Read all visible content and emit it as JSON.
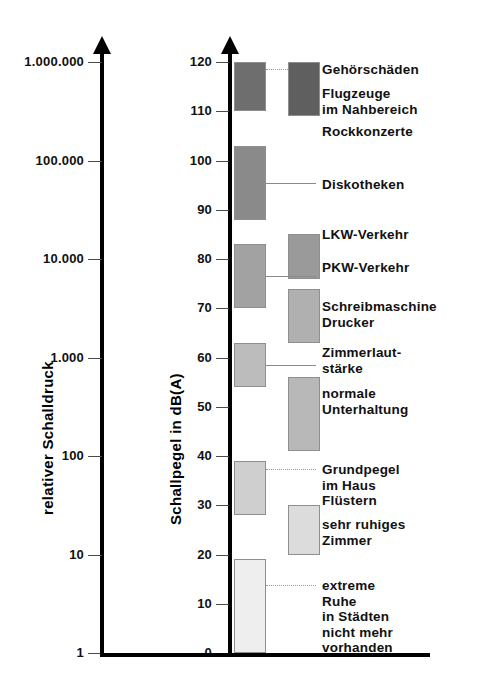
{
  "chart_data": {
    "type": "bar",
    "title": "",
    "subtitle": "",
    "orientation": "vertical-ranges",
    "grid": false,
    "legend": null,
    "left_axis": {
      "label": "relativer Schalldruck",
      "scale": "log",
      "tick_labels": [
        "1.000.000",
        "100.000",
        "10.000",
        "1.000",
        "100",
        "10",
        "1"
      ],
      "tick_values": [
        1000000,
        100000,
        10000,
        1000,
        100,
        10,
        1
      ],
      "tick_db_equivalent": [
        120,
        100,
        80,
        60,
        40,
        20,
        0
      ]
    },
    "right_axis": {
      "label": "Schallpegel in dB(A)",
      "scale": "linear",
      "ylim": [
        0,
        120
      ],
      "tick_labels": [
        "120",
        "110",
        "100",
        "90",
        "80",
        "70",
        "60",
        "50",
        "40",
        "30",
        "20",
        "10",
        "0"
      ],
      "tick_values": [
        120,
        110,
        100,
        90,
        80,
        70,
        60,
        50,
        40,
        30,
        20,
        10,
        0
      ]
    },
    "ylabel": "Schallpegel in dB(A)",
    "xlabel": "",
    "bars": [
      {
        "name": "Gehörschäden",
        "column": 1,
        "db_low": 110,
        "db_high": 120,
        "color": "#6e6e6e",
        "label": "Gehörschäden",
        "leader": "dotted"
      },
      {
        "name": "Flugzeuge im Nahbereich",
        "column": 2,
        "db_low": 109,
        "db_high": 120,
        "color": "#5f5f5f",
        "label": "Flugzeuge\nim Nahbereich",
        "leader": "solid"
      },
      {
        "name": "Rockkonzerte",
        "column": 0,
        "db_low": null,
        "db_high": null,
        "color": null,
        "label": "Rockkonzerte",
        "leader": "none"
      },
      {
        "name": "Diskotheken",
        "column": 1,
        "db_low": 88,
        "db_high": 103,
        "color": "#8a8a8a",
        "label": "Diskotheken",
        "leader": "solid"
      },
      {
        "name": "LKW-Verkehr",
        "column": 2,
        "db_low": 76,
        "db_high": 85,
        "color": "#9a9a9a",
        "label": "LKW-Verkehr",
        "leader": "solid"
      },
      {
        "name": "PKW-Verkehr",
        "column": 1,
        "db_low": 70,
        "db_high": 83,
        "color": "#a2a2a2",
        "label": "PKW-Verkehr",
        "leader": "solid"
      },
      {
        "name": "Schreibmaschine Drucker",
        "column": 2,
        "db_low": 63,
        "db_high": 74,
        "color": "#b0b0b0",
        "label": "Schreibmaschine\nDrucker",
        "leader": "solid"
      },
      {
        "name": "Zimmerlautstärke",
        "column": 1,
        "db_low": 54,
        "db_high": 63,
        "color": "#bcbcbc",
        "label": "Zimmerlaut-\nstärke",
        "leader": "solid"
      },
      {
        "name": "normale Unterhaltung",
        "column": 2,
        "db_low": 41,
        "db_high": 56,
        "color": "#b8b8b8",
        "label": "normale\nUnterhaltung",
        "leader": "solid"
      },
      {
        "name": "Grundpegel im Haus / Flüstern",
        "column": 1,
        "db_low": 28,
        "db_high": 39,
        "color": "#cfcfcf",
        "label": "Grundpegel\nim Haus\nFlüstern",
        "leader": "dotted"
      },
      {
        "name": "sehr ruhiges Zimmer",
        "column": 2,
        "db_low": 20,
        "db_high": 30,
        "color": "#dcdcdc",
        "label": "sehr ruhiges\nZimmer",
        "leader": "solid"
      },
      {
        "name": "extreme Ruhe",
        "column": 1,
        "db_low": 0,
        "db_high": 19,
        "color": "#eeeeee",
        "label": "extreme\nRuhe\nin Städten\nnicht mehr\nvorhanden",
        "leader": "dotted"
      }
    ]
  }
}
